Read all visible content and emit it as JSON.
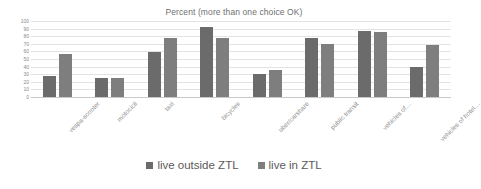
{
  "chart_data": {
    "type": "bar",
    "title": "Percent (more than one choice OK)",
    "xlabel": "",
    "ylabel": "",
    "ylim": [
      0,
      100
    ],
    "ytick_step": 10,
    "yticks": [
      100,
      90,
      80,
      70,
      60,
      50,
      40,
      30,
      20,
      10,
      0
    ],
    "grid": true,
    "legend_position": "bottom",
    "categories": [
      "vespa-scooter",
      "motocicli",
      "taxi",
      "bicycles",
      "uber/carshare",
      "public transit",
      "vehicles of…",
      "vehicles of hotel…"
    ],
    "series": [
      {
        "name": "live outside ZTL",
        "color": "#6b6b6b",
        "values": [
          27,
          25,
          59,
          92,
          30,
          77,
          87,
          39
        ]
      },
      {
        "name": "live in ZTL",
        "color": "#7e7e7e",
        "values": [
          57,
          25,
          78,
          77,
          35,
          70,
          86,
          69
        ]
      }
    ]
  },
  "colors": {
    "series_outside_ztl": "#6b6b6b",
    "series_in_ztl": "#7e7e7e",
    "gridline": "#e3e3e3",
    "axis": "#c9c9c9",
    "title_text": "#6f6f6f",
    "tick_text": "#8a8a8a",
    "legend_text": "#5a5a5a",
    "background": "#ffffff"
  }
}
